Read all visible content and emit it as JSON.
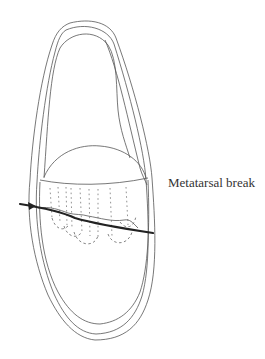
{
  "figure": {
    "annotation": {
      "label": "Metatarsal break"
    },
    "colors": {
      "outline": "#555555",
      "break_line": "#222222",
      "label": "#333333",
      "background": "#ffffff"
    }
  }
}
